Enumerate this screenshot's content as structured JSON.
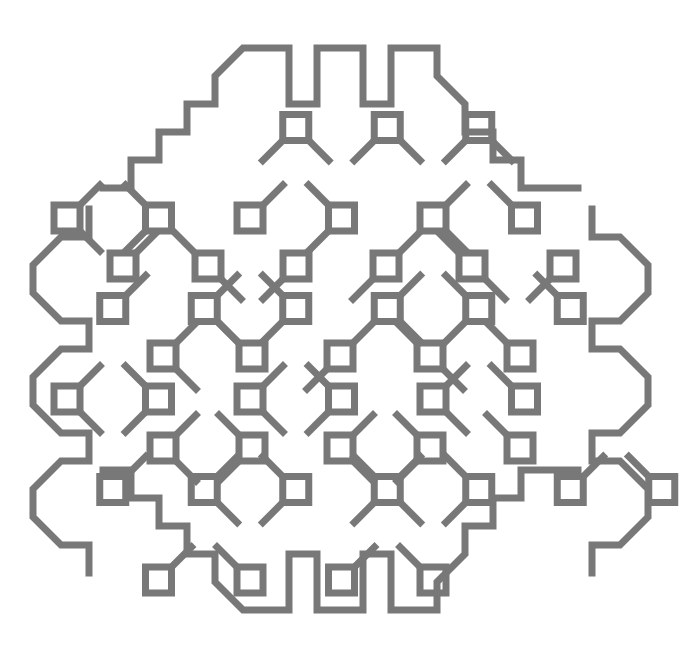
{
  "artwork": {
    "title": "Geometric square-lattice medallion",
    "type": "line-art-pattern",
    "canvas": {
      "width": 681,
      "height": 659,
      "background": "#ffffff"
    },
    "stroke": {
      "color": "#787878",
      "width": 7,
      "linecap": "square",
      "linejoin": "miter"
    },
    "lattice": {
      "origin_x": 67,
      "origin_y": 37,
      "step_x": 91.5,
      "step_y": 90.5,
      "cols": 7,
      "rows": 7,
      "square_size": 26,
      "diagonal_arm": 20
    },
    "description": "A radially symmetric medallion built from small open squares placed on a staggered square lattice, joined at their corners by 45-degree diagonal links, and bounded by a scalloped octagonal frame.",
    "node_count": 45,
    "link_count": 58
  }
}
